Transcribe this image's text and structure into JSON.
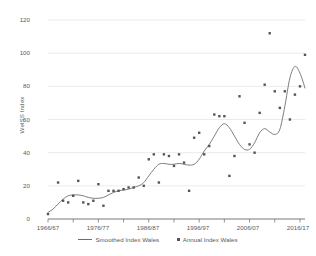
{
  "chart_data": {
    "type": "line",
    "title": "",
    "xlabel": "",
    "ylabel": "WelSS Index",
    "ylim": [
      0,
      120
    ],
    "yticks": [
      0,
      20,
      40,
      60,
      80,
      100,
      120
    ],
    "ytick_labels": [
      "0",
      "20",
      "40",
      "60",
      "80",
      "100",
      "120"
    ],
    "xtick_labels": [
      "1966/67",
      "1976/77",
      "1986/87",
      "1996/97",
      "2006/07",
      "2016/17"
    ],
    "xtick_years": [
      1966,
      1976,
      1986,
      1996,
      2006,
      2016
    ],
    "xlim": [
      1966,
      2017
    ],
    "grid": "horizontal",
    "legend_position": "bottom",
    "series": [
      {
        "name": "Smoothed Index Wales",
        "style": "line",
        "color": "#6e6e6e",
        "x": [
          1966,
          1967,
          1968,
          1969,
          1970,
          1971,
          1972,
          1973,
          1974,
          1975,
          1976,
          1977,
          1978,
          1979,
          1980,
          1981,
          1982,
          1983,
          1984,
          1985,
          1986,
          1987,
          1988,
          1989,
          1990,
          1991,
          1992,
          1993,
          1994,
          1995,
          1996,
          1997,
          1998,
          1999,
          2000,
          2001,
          2002,
          2003,
          2004,
          2005,
          2006,
          2007,
          2008,
          2009,
          2010,
          2011,
          2012,
          2013,
          2014,
          2015,
          2016,
          2017
        ],
        "values": [
          4,
          6,
          9,
          12,
          14,
          14.5,
          14.5,
          14,
          13,
          12.5,
          12.5,
          13,
          14.5,
          16,
          17,
          17.5,
          18,
          19,
          20,
          22,
          26,
          30,
          33,
          33.5,
          33,
          33,
          33.5,
          33,
          32.5,
          33,
          36,
          41,
          45,
          50,
          55,
          57.5,
          55,
          50,
          45,
          42,
          42,
          46,
          52,
          54.5,
          52.5,
          51,
          54,
          68,
          85,
          92,
          88,
          79
        ]
      },
      {
        "name": "Annual Index Wales",
        "style": "scatter",
        "color": "#555555",
        "x": [
          1966,
          1968,
          1969,
          1970,
          1971,
          1972,
          1973,
          1974,
          1975,
          1976,
          1977,
          1978,
          1979,
          1980,
          1981,
          1982,
          1983,
          1984,
          1985,
          1986,
          1987,
          1988,
          1989,
          1990,
          1991,
          1992,
          1993,
          1994,
          1995,
          1996,
          1997,
          1998,
          1999,
          2000,
          2001,
          2002,
          2003,
          2004,
          2005,
          2006,
          2007,
          2008,
          2009,
          2010,
          2011,
          2012,
          2013,
          2014,
          2015,
          2016,
          2017
        ],
        "values": [
          3,
          22,
          11,
          10,
          14,
          23,
          10,
          9,
          11,
          21,
          8,
          17,
          17,
          17,
          18,
          19,
          19,
          25,
          20,
          36,
          39,
          22,
          39,
          38,
          32,
          39,
          34,
          17,
          49,
          52,
          39,
          44,
          63,
          62,
          62,
          26,
          38,
          74,
          58,
          45,
          40,
          64,
          81,
          112,
          77,
          67,
          77,
          60,
          75,
          80,
          99
        ]
      }
    ]
  },
  "legend": {
    "smoothed_label": "Smoothed Index Wales",
    "annual_label": "Annual Index Wales"
  }
}
